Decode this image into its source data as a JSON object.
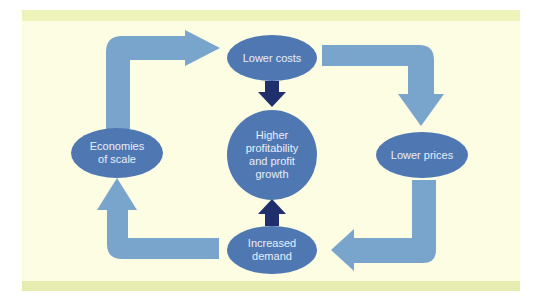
{
  "diagram": {
    "type": "cycle",
    "colors": {
      "background": "#fdfde4",
      "band": "#eef3b9",
      "node_fill": "#4f78b3",
      "cycle_arrow": "#79a5cd",
      "center_arrow": "#20306c",
      "node_text": "#e8eef8"
    },
    "nodes": {
      "top": "Lower costs",
      "right": "Lower prices",
      "bottom": "Increased demand",
      "left": "Economies of scale",
      "center": "Higher profitability and profit growth"
    },
    "labels": {
      "top": [
        "Lower costs"
      ],
      "right": [
        "Lower prices"
      ],
      "bottom": [
        "Increased",
        "demand"
      ],
      "left": [
        "Economies",
        "of scale"
      ],
      "center": [
        "Higher",
        "profitability",
        "and profit",
        "growth"
      ]
    },
    "edges": [
      {
        "from": "Lower costs",
        "to": "Lower prices"
      },
      {
        "from": "Lower prices",
        "to": "Increased demand"
      },
      {
        "from": "Increased demand",
        "to": "Economies of scale"
      },
      {
        "from": "Economies of scale",
        "to": "Lower costs"
      },
      {
        "from": "Lower costs",
        "to": "Higher profitability and profit growth"
      },
      {
        "from": "Increased demand",
        "to": "Higher profitability and profit growth"
      }
    ]
  }
}
